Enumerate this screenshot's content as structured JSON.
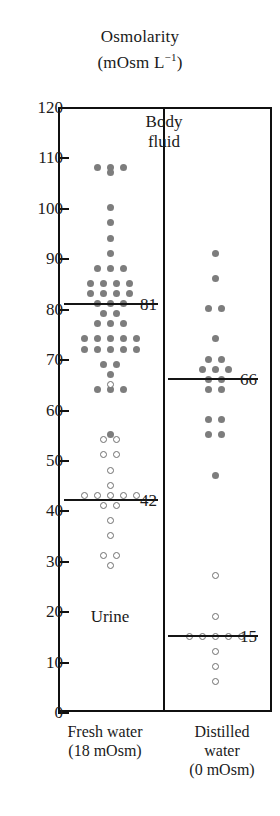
{
  "chart_data": {
    "type": "scatter",
    "title": "Osmolarity (mOsm L−1)",
    "title_line1": "Osmolarity",
    "title_line2_prefix": "(mOsm  L",
    "title_line2_sup": "−1",
    "title_line2_suffix": ")",
    "ylabel": "Osmolarity (mOsm L−1)",
    "xlabel": "",
    "ylim": [
      0,
      120
    ],
    "yticks": [
      0,
      10,
      20,
      30,
      40,
      50,
      60,
      70,
      80,
      90,
      100,
      110,
      120
    ],
    "grid": false,
    "legend": "none",
    "annotations": [
      {
        "text": "Body fluid",
        "line1": "Body",
        "line2": "fluid",
        "position": "top-left-panel"
      },
      {
        "text": "Urine",
        "position": "bottom-left-panel"
      }
    ],
    "groups": [
      {
        "name": "Fresh water",
        "xlabel_line1": "Fresh water",
        "xlabel_line2": "(18 mOsm)",
        "xlabel_line3": "",
        "series": [
          {
            "name": "Body fluid",
            "marker": "filled-circle",
            "mean": 81,
            "mean_label": "81",
            "values": [
              108,
              108,
              108,
              107,
              100,
              97,
              94,
              91,
              88,
              88,
              88,
              85,
              85,
              85,
              85,
              83,
              83,
              83,
              83,
              81,
              81,
              81,
              79,
              79,
              77,
              77,
              77,
              74,
              74,
              74,
              74,
              74,
              72,
              72,
              72,
              72,
              72,
              69,
              69,
              67,
              64,
              64,
              64,
              55
            ]
          },
          {
            "name": "Urine",
            "marker": "open-circle",
            "mean": 42,
            "mean_label": "42",
            "values": [
              65,
              54,
              54,
              51,
              51,
              48,
              45,
              43,
              43,
              43,
              43,
              43,
              41,
              41,
              38,
              35,
              31,
              31,
              29
            ]
          }
        ]
      },
      {
        "name": "Distilled water",
        "xlabel_line1": "Distilled",
        "xlabel_line2": "water",
        "xlabel_line3": "(0 mOsm)",
        "series": [
          {
            "name": "Body fluid",
            "marker": "filled-circle",
            "mean": 66,
            "mean_label": "66",
            "values": [
              91,
              86,
              80,
              80,
              74,
              70,
              70,
              68,
              68,
              68,
              66,
              66,
              64,
              64,
              58,
              58,
              55,
              55,
              47
            ]
          },
          {
            "name": "Urine",
            "marker": "open-circle",
            "mean": 15,
            "mean_label": "15",
            "values": [
              27,
              19,
              15,
              15,
              15,
              15,
              15,
              12,
              9,
              6
            ]
          }
        ]
      }
    ]
  },
  "ticks": {
    "labels": [
      "120",
      "110",
      "100",
      "90",
      "80",
      "70",
      "60",
      "50",
      "40",
      "30",
      "20",
      "10",
      "0"
    ]
  }
}
